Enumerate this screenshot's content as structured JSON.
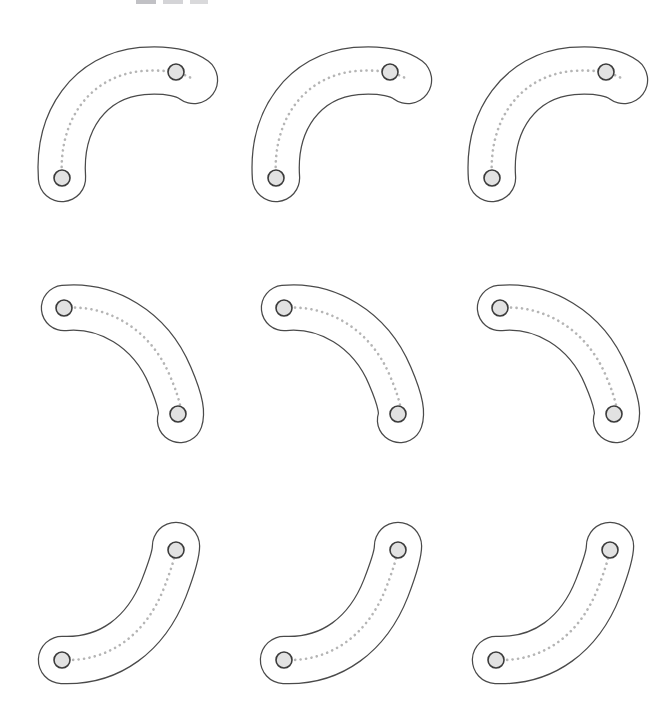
{
  "figure": {
    "title": "",
    "background_color": "#ffffff",
    "width": 659,
    "height": 719,
    "grid_rows": 3,
    "grid_cols": 3,
    "shape_count": 9
  },
  "style": {
    "outline_color": "#4a4a4a",
    "outline_width": 1.25,
    "fill_color": "#ffffff",
    "axis_color": "#b5b5b5",
    "axis_style": "dotted",
    "endpoint_fill": "#e2e2e2",
    "endpoint_stroke": "#3b3b3b",
    "endpoint_radius": 8
  },
  "top_fragments": [
    {
      "name": "fragment-1",
      "x": 136,
      "width": 20,
      "color": "#a9a9ae"
    },
    {
      "name": "fragment-2",
      "x": 163,
      "width": 20,
      "color": "#c3c3c7"
    },
    {
      "name": "fragment-3",
      "x": 190,
      "width": 18,
      "color": "#cacacd"
    }
  ],
  "shapes": [
    {
      "id": "shape-r1c1",
      "row": 1,
      "col": 1,
      "label": "curved-blob-row1-col1",
      "orientation": "elbow-up-right",
      "left": 18,
      "top": 28,
      "width": 200,
      "height": 190,
      "thickness": 46,
      "axis": "M 44 150 C 40 92, 72 48, 124 43 C 152 41, 168 46, 176 52",
      "endpoints": [
        {
          "name": "endpoint-start",
          "x": 44,
          "y": 150
        },
        {
          "name": "endpoint-end",
          "x": 158,
          "y": 44
        }
      ]
    },
    {
      "id": "shape-r1c2",
      "row": 1,
      "col": 2,
      "label": "curved-blob-row1-col2",
      "orientation": "elbow-up-right",
      "left": 232,
      "top": 28,
      "width": 200,
      "height": 190,
      "thickness": 46,
      "axis": "M 44 150 C 40 92, 72 48, 124 43 C 152 41, 168 46, 176 52",
      "endpoints": [
        {
          "name": "endpoint-start",
          "x": 44,
          "y": 150
        },
        {
          "name": "endpoint-end",
          "x": 158,
          "y": 44
        }
      ]
    },
    {
      "id": "shape-r1c3",
      "row": 1,
      "col": 3,
      "label": "curved-blob-row1-col3",
      "orientation": "elbow-up-right",
      "left": 448,
      "top": 28,
      "width": 200,
      "height": 190,
      "thickness": 46,
      "axis": "M 44 150 C 40 92, 72 48, 124 43 C 152 41, 168 46, 176 52",
      "endpoints": [
        {
          "name": "endpoint-start",
          "x": 44,
          "y": 150
        },
        {
          "name": "endpoint-end",
          "x": 158,
          "y": 44
        }
      ]
    },
    {
      "id": "shape-r2c1",
      "row": 2,
      "col": 1,
      "label": "curved-blob-row2-col1",
      "orientation": "elbow-down-right",
      "left": 22,
      "top": 272,
      "width": 190,
      "height": 175,
      "thickness": 44,
      "axis": "M 42 36 C 84 32, 128 56, 148 104 C 160 132, 160 142, 158 148",
      "endpoints": [
        {
          "name": "endpoint-start",
          "x": 42,
          "y": 36
        },
        {
          "name": "endpoint-end",
          "x": 156,
          "y": 142
        }
      ]
    },
    {
      "id": "shape-r2c2",
      "row": 2,
      "col": 2,
      "label": "curved-blob-row2-col2",
      "orientation": "elbow-down-right",
      "left": 242,
      "top": 272,
      "width": 190,
      "height": 175,
      "thickness": 44,
      "axis": "M 42 36 C 84 32, 128 56, 148 104 C 160 132, 160 142, 158 148",
      "endpoints": [
        {
          "name": "endpoint-start",
          "x": 42,
          "y": 36
        },
        {
          "name": "endpoint-end",
          "x": 156,
          "y": 142
        }
      ]
    },
    {
      "id": "shape-r2c3",
      "row": 2,
      "col": 3,
      "label": "curved-blob-row2-col3",
      "orientation": "elbow-down-right",
      "left": 458,
      "top": 272,
      "width": 190,
      "height": 175,
      "thickness": 44,
      "axis": "M 42 36 C 84 32, 128 56, 148 104 C 160 132, 160 142, 158 148",
      "endpoints": [
        {
          "name": "endpoint-start",
          "x": 42,
          "y": 36
        },
        {
          "name": "endpoint-end",
          "x": 156,
          "y": 142
        }
      ]
    },
    {
      "id": "shape-r3c1",
      "row": 3,
      "col": 1,
      "label": "curved-blob-row3-col1",
      "orientation": "elbow-up-right-steep",
      "left": 18,
      "top": 512,
      "width": 200,
      "height": 190,
      "thickness": 46,
      "axis": "M 44 148 C 92 150, 128 122, 146 76 C 156 50, 158 40, 158 34",
      "endpoints": [
        {
          "name": "endpoint-start",
          "x": 44,
          "y": 148
        },
        {
          "name": "endpoint-end",
          "x": 158,
          "y": 38
        }
      ]
    },
    {
      "id": "shape-r3c2",
      "row": 3,
      "col": 2,
      "label": "curved-blob-row3-col2",
      "orientation": "elbow-up-right-steep",
      "left": 240,
      "top": 512,
      "width": 200,
      "height": 190,
      "thickness": 46,
      "axis": "M 44 148 C 92 150, 128 122, 146 76 C 156 50, 158 40, 158 34",
      "endpoints": [
        {
          "name": "endpoint-start",
          "x": 44,
          "y": 148
        },
        {
          "name": "endpoint-end",
          "x": 158,
          "y": 38
        }
      ]
    },
    {
      "id": "shape-r3c3",
      "row": 3,
      "col": 3,
      "label": "curved-blob-row3-col3",
      "orientation": "elbow-up-right-steep",
      "left": 452,
      "top": 512,
      "width": 200,
      "height": 190,
      "thickness": 46,
      "axis": "M 44 148 C 92 150, 128 122, 146 76 C 156 50, 158 40, 158 34",
      "endpoints": [
        {
          "name": "endpoint-start",
          "x": 44,
          "y": 148
        },
        {
          "name": "endpoint-end",
          "x": 158,
          "y": 38
        }
      ]
    }
  ]
}
